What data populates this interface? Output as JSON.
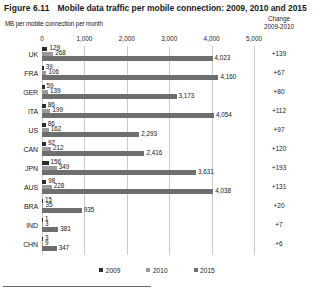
{
  "figure": {
    "number": "Figure 6.11",
    "title": "Mobile data traffic per mobile connection: 2009, 2010 and 2015",
    "unit_label": "MB per mobile connection per month",
    "change_header_line1": "Change",
    "change_header_line2": "2009-2010"
  },
  "legend": {
    "items": [
      {
        "label": "2009",
        "color": "#2b2b2b"
      },
      {
        "label": "2010",
        "color": "#9a9a9a"
      },
      {
        "label": "2015",
        "color": "#6e6e6e"
      }
    ]
  },
  "chart_data": {
    "type": "bar",
    "orientation": "horizontal",
    "title": "Mobile data traffic per mobile connection: 2009, 2010 and 2015",
    "xlabel": "MB per mobile connection per month",
    "ylabel": "",
    "xlim": [
      0,
      5000
    ],
    "xticks": [
      0,
      1000,
      2000,
      3000,
      4000,
      5000
    ],
    "xtick_labels": [
      "0",
      "1,000",
      "2,000",
      "3,000",
      "4,000",
      "5,000"
    ],
    "grid": true,
    "legend_position": "bottom",
    "categories": [
      "UK",
      "FRA",
      "GER",
      "ITA",
      "US",
      "CAN",
      "JPN",
      "AUS",
      "BRA",
      "IND",
      "CHN"
    ],
    "series": [
      {
        "name": "2009",
        "color": "#2b2b2b",
        "values": [
          129,
          39,
          59,
          86,
          86,
          92,
          156,
          98,
          15,
          1,
          3
        ]
      },
      {
        "name": "2010",
        "color": "#9a9a9a",
        "values": [
          268,
          106,
          139,
          199,
          162,
          212,
          349,
          228,
          35,
          3,
          9
        ]
      },
      {
        "name": "2015",
        "color": "#6e6e6e",
        "values": [
          4023,
          4160,
          3173,
          4054,
          2293,
          2416,
          3631,
          4038,
          935,
          381,
          347
        ]
      }
    ],
    "data_labels": {
      "2009": [
        "129",
        "39",
        "59",
        "86",
        "86",
        "92",
        "156",
        "98",
        "15",
        "1",
        "3"
      ],
      "2010": [
        "268",
        "106",
        "139",
        "199",
        "162",
        "212",
        "349",
        "228",
        "35",
        "3",
        "9"
      ],
      "2015": [
        "4,023",
        "4,160",
        "3,173",
        "4,054",
        "2,293",
        "2,416",
        "3,631",
        "4,038",
        "935",
        "381",
        "347"
      ]
    },
    "annotation_column": {
      "header": "Change 2009-2010",
      "values": [
        "+139",
        "+67",
        "+80",
        "+112",
        "+97",
        "+120",
        "+193",
        "+131",
        "+20",
        "+7",
        "+6"
      ]
    }
  }
}
